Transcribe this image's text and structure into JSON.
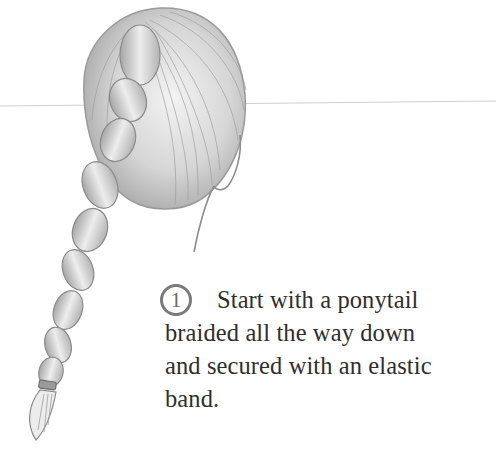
{
  "illustration": {
    "subject": "back view of head with ponytail braided down and secured with elastic band",
    "style": "pencil sketch",
    "stroke_color": "#8a8a8a",
    "shade_color": "#bdbdbd"
  },
  "step": {
    "number": "1",
    "lines": [
      "Start with a ponytail",
      "braided all the way down",
      "and secured with an elastic",
      "band."
    ],
    "text_color": "#2e2e2e",
    "badge_color": "#7a7a7a"
  },
  "guide_line": {
    "color": "#c8c8c8"
  }
}
